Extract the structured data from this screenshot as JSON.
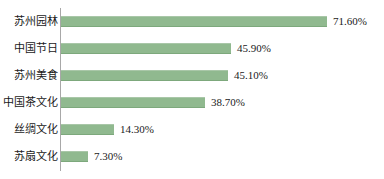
{
  "chart_data": {
    "type": "bar",
    "orientation": "horizontal",
    "title": "",
    "xlabel": "",
    "ylabel": "",
    "xlim": [
      0,
      80
    ],
    "grid": false,
    "legend": false,
    "bar_color": "#90b98f",
    "axis_color": "#a8a8a8",
    "background": "#ffffff",
    "value_suffix": "%",
    "categories": [
      "苏州园林",
      "中国节日",
      "苏州美食",
      "中国茶文化",
      "丝绸文化",
      "苏扇文化"
    ],
    "values": [
      71.6,
      45.9,
      45.1,
      38.7,
      14.3,
      7.3
    ],
    "value_labels": [
      "71.60%",
      "45.90%",
      "45.10%",
      "38.70%",
      "14.30%",
      "7.30%"
    ],
    "bars": [
      {
        "category": "苏州园林",
        "value": 71.6,
        "label": "71.60%"
      },
      {
        "category": "中国节日",
        "value": 45.9,
        "label": "45.90%"
      },
      {
        "category": "苏州美食",
        "value": 45.1,
        "label": "45.10%"
      },
      {
        "category": "中国茶文化",
        "value": 38.7,
        "label": "38.70%"
      },
      {
        "category": "丝绸文化",
        "value": 14.3,
        "label": "14.30%"
      },
      {
        "category": "苏扇文化",
        "value": 7.3,
        "label": "7.30%"
      }
    ]
  }
}
